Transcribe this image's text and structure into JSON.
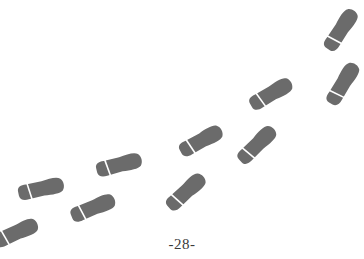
{
  "page": {
    "page_number": "-28-"
  },
  "illustration": {
    "subject": "footprints-trail",
    "color": "#6b6b6b",
    "divider_color": "#ffffff",
    "footprints": [
      {
        "id": 1,
        "cx": 341,
        "cy": 30,
        "angle": -56,
        "length": 46,
        "width": 16
      },
      {
        "id": 2,
        "cx": 343,
        "cy": 84,
        "angle": -58,
        "length": 46,
        "width": 16
      },
      {
        "id": 3,
        "cx": 271,
        "cy": 94,
        "angle": -30,
        "length": 46,
        "width": 16
      },
      {
        "id": 4,
        "cx": 257,
        "cy": 145,
        "angle": -44,
        "length": 46,
        "width": 16
      },
      {
        "id": 5,
        "cx": 201,
        "cy": 141,
        "angle": -28,
        "length": 46,
        "width": 16
      },
      {
        "id": 6,
        "cx": 186,
        "cy": 192,
        "angle": -42,
        "length": 46,
        "width": 16
      },
      {
        "id": 7,
        "cx": 119,
        "cy": 165,
        "angle": -14,
        "length": 46,
        "width": 16
      },
      {
        "id": 8,
        "cx": 93,
        "cy": 208,
        "angle": -22,
        "length": 46,
        "width": 16
      },
      {
        "id": 9,
        "cx": 41,
        "cy": 189,
        "angle": -12,
        "length": 46,
        "width": 16
      },
      {
        "id": 10,
        "cx": 16,
        "cy": 233,
        "angle": -24,
        "length": 46,
        "width": 16
      }
    ]
  }
}
